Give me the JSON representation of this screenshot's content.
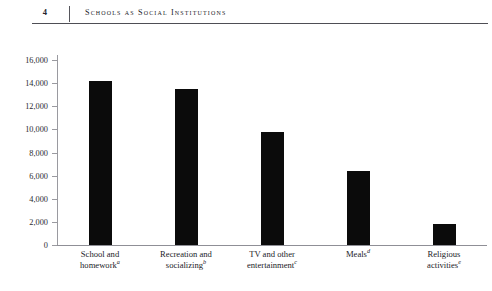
{
  "page": {
    "folio": "4",
    "running_head": "Schools as Social Institutions"
  },
  "chart_data": {
    "type": "bar",
    "title": "",
    "xlabel": "",
    "ylabel": "",
    "ylim": [
      0,
      16000
    ],
    "ytick_step": 2000,
    "grid": false,
    "legend": null,
    "categories": [
      "School and homework",
      "Recreation and socializing",
      "TV and other entertainment",
      "Meals",
      "Religious activities"
    ],
    "category_footnotes": [
      "a",
      "b",
      "c",
      "d",
      "e"
    ],
    "category_lines": [
      [
        "School and",
        "homework"
      ],
      [
        "Recreation and",
        "socializing"
      ],
      [
        "TV and other",
        "entertainment"
      ],
      [
        "Meals",
        ""
      ],
      [
        "Religious",
        "activities"
      ]
    ],
    "values": [
      14200,
      13500,
      9800,
      6400,
      1800
    ],
    "ytick_labels": [
      "0",
      "2,000",
      "4,000",
      "6,000",
      "8,000",
      "10,000",
      "12,000",
      "14,000",
      "16,000"
    ],
    "ytick_values": [
      0,
      2000,
      4000,
      6000,
      8000,
      10000,
      12000,
      14000,
      16000
    ],
    "bar_color": "#0b0b0b",
    "axis_color": "#8f8f96"
  }
}
